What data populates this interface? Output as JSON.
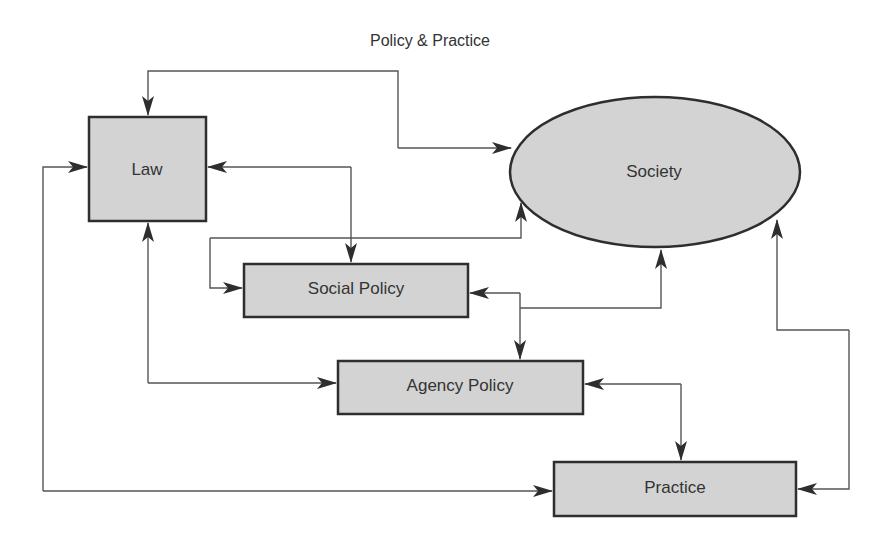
{
  "title": "Policy & Practice",
  "colors": {
    "node_fill": "#d3d3d3",
    "node_stroke": "#2e2e2e",
    "edge": "#555555",
    "text": "#333333",
    "background": "#ffffff"
  },
  "nodes": {
    "law": {
      "label": "Law",
      "shape": "rectangle"
    },
    "society": {
      "label": "Society",
      "shape": "ellipse"
    },
    "social_policy": {
      "label": "Social Policy",
      "shape": "rectangle"
    },
    "agency_policy": {
      "label": "Agency Policy",
      "shape": "rectangle"
    },
    "practice": {
      "label": "Practice",
      "shape": "rectangle"
    }
  },
  "edges": [
    {
      "from": "Society",
      "to": "Law",
      "direction": "bidirectional"
    },
    {
      "from": "Law",
      "to": "Social Policy",
      "direction": "bidirectional"
    },
    {
      "from": "Social Policy",
      "to": "Society",
      "direction": "bidirectional"
    },
    {
      "from": "Social Policy",
      "to": "Agency Policy",
      "direction": "bidirectional"
    },
    {
      "from": "Law",
      "to": "Agency Policy",
      "direction": "bidirectional"
    },
    {
      "from": "Agency Policy",
      "to": "Practice",
      "direction": "bidirectional"
    },
    {
      "from": "Law",
      "to": "Practice",
      "direction": "bidirectional"
    },
    {
      "from": "Practice",
      "to": "Society",
      "direction": "bidirectional"
    }
  ]
}
